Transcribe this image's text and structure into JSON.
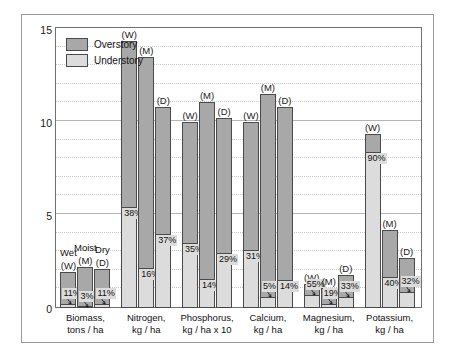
{
  "chart_data": {
    "type": "bar",
    "title": "",
    "xlabel": "",
    "ylabel": "",
    "ylim": [
      0,
      15
    ],
    "yticks": [
      0,
      5,
      10,
      15
    ],
    "ytick_labels": [
      "0",
      "5",
      "10",
      "15"
    ],
    "minor_gridline_step": 1,
    "grid": true,
    "legend_position": "top-left",
    "stacked": true,
    "legend": [
      {
        "label": "Overstory",
        "color": "#a8a8a8"
      },
      {
        "label": "Understory",
        "color": "#dcdcdc"
      }
    ],
    "site_codes": [
      {
        "name": "Wet",
        "code": "(W)"
      },
      {
        "name": "Moist",
        "code": "(M)"
      },
      {
        "name": "Dry",
        "code": "(D)"
      }
    ],
    "categories": [
      "Biomass, tons / ha",
      "Nitrogen, kg / ha",
      "Phosphorus, kg / ha x 10",
      "Calcium, kg / ha",
      "Magnesium, kg / ha",
      "Potassium, kg / ha"
    ],
    "groups": [
      {
        "name": "Biomass",
        "unit_line1": "Biomass,",
        "unit_line2": "tons / ha",
        "bars": [
          {
            "site": "(W)",
            "site_name": "Wet",
            "total": 1.95,
            "understory_pct": "11%",
            "understory_value": 0.21
          },
          {
            "site": "(M)",
            "site_name": "Moist",
            "total": 2.2,
            "understory_pct": "3%",
            "understory_value": 0.07
          },
          {
            "site": "(D)",
            "site_name": "Dry",
            "total": 2.1,
            "understory_pct": "11%",
            "understory_value": 0.23
          }
        ]
      },
      {
        "name": "Nitrogen",
        "unit_line1": "Nitrogen,",
        "unit_line2": "kg / ha",
        "bars": [
          {
            "site": "(W)",
            "site_name": "Wet",
            "total": 14.35,
            "understory_pct": "38%",
            "understory_value": 5.45
          },
          {
            "site": "(M)",
            "site_name": "Moist",
            "total": 13.5,
            "understory_pct": "16%",
            "understory_value": 2.16
          },
          {
            "site": "(D)",
            "site_name": "Dry",
            "total": 10.8,
            "understory_pct": "37%",
            "understory_value": 4.0
          }
        ]
      },
      {
        "name": "Phosphorus",
        "unit_line1": "Phosphorus,",
        "unit_line2": "kg / ha x 10",
        "bars": [
          {
            "site": "(W)",
            "site_name": "Wet",
            "total": 10.0,
            "understory_pct": "35%",
            "understory_value": 3.5
          },
          {
            "site": "(M)",
            "site_name": "Moist",
            "total": 11.1,
            "understory_pct": "14%",
            "understory_value": 1.55
          },
          {
            "site": "(D)",
            "site_name": "Dry",
            "total": 10.2,
            "understory_pct": "29%",
            "understory_value": 2.96
          }
        ]
      },
      {
        "name": "Calcium",
        "unit_line1": "Calcium,",
        "unit_line2": "kg / ha",
        "bars": [
          {
            "site": "(W)",
            "site_name": "Wet",
            "total": 10.0,
            "understory_pct": "31%",
            "understory_value": 3.1
          },
          {
            "site": "(M)",
            "site_name": "Moist",
            "total": 11.5,
            "understory_pct": "5%",
            "understory_value": 0.58
          },
          {
            "site": "(D)",
            "site_name": "Dry",
            "total": 10.8,
            "understory_pct": "14%",
            "understory_value": 1.51
          }
        ]
      },
      {
        "name": "Magnesium",
        "unit_line1": "Magnesium,",
        "unit_line2": "kg / ha",
        "bars": [
          {
            "site": "(W)",
            "site_name": "Wet",
            "total": 1.3,
            "understory_pct": "55%",
            "understory_value": 0.72
          },
          {
            "site": "(M)",
            "site_name": "Moist",
            "total": 1.1,
            "understory_pct": "19%",
            "understory_value": 0.21
          },
          {
            "site": "(D)",
            "site_name": "Dry",
            "total": 1.8,
            "understory_pct": "33%",
            "understory_value": 0.6
          }
        ]
      },
      {
        "name": "Potassium",
        "unit_line1": "Potassium,",
        "unit_line2": "kg / ha",
        "bars": [
          {
            "site": "(W)",
            "site_name": "Wet",
            "total": 9.35,
            "understory_pct": "90%",
            "understory_value": 8.4
          },
          {
            "site": "(M)",
            "site_name": "Moist",
            "total": 4.2,
            "understory_pct": "40%",
            "understory_value": 1.68
          },
          {
            "site": "(D)",
            "site_name": "Dry",
            "total": 2.7,
            "understory_pct": "32%",
            "understory_value": 0.86
          }
        ]
      }
    ],
    "annotations": [
      {
        "text": "Wet",
        "near": "biomass-wet"
      },
      {
        "text": "Moist",
        "near": "biomass-moist"
      },
      {
        "text": "Dry",
        "near": "biomass-dry"
      }
    ]
  },
  "colors": {
    "overstory": "#a8a8a8",
    "understory": "#dcdcdc",
    "bar_border": "#4a4a4a",
    "axis": "#6f6f6f",
    "gridline_minor": "#c9c9c9",
    "gridline_major": "#b4b4b4",
    "text": "#111111",
    "background": "#ffffff"
  }
}
